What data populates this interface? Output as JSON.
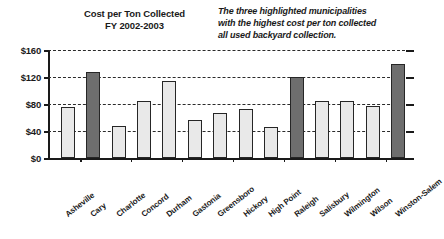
{
  "chart_data": {
    "type": "bar",
    "title": "Cost per Ton Collected FY 2002-2003",
    "title_lines": [
      "Cost per Ton Collected",
      "FY 2002-2003"
    ],
    "annotation": "The three highlighted municipalities with the highest cost per ton collected all used backyard collection.",
    "annotation_lines": [
      "The three highlighted municipalities",
      "with the highest cost per ton collected",
      "all used backyard collection."
    ],
    "xlabel": "",
    "ylabel": "",
    "ylim": [
      0,
      160
    ],
    "grid": true,
    "legend": "none",
    "ytick_labels": [
      "$0",
      "$40",
      "$80",
      "$120",
      "$160"
    ],
    "ytick_values": [
      0,
      40,
      80,
      120,
      160
    ],
    "categories": [
      "Asheville",
      "Cary",
      "Charlotte",
      "Concord",
      "Durham",
      "Gastonia",
      "Greensboro",
      "Hickory",
      "High Point",
      "Raleigh",
      "Salisbury",
      "Wilmington",
      "Wilson",
      "Winston-Salem"
    ],
    "values": [
      75,
      128,
      47,
      85,
      114,
      56,
      67,
      73,
      46,
      120,
      84,
      84,
      77,
      139
    ],
    "highlighted": [
      false,
      true,
      false,
      false,
      false,
      false,
      false,
      false,
      false,
      true,
      false,
      false,
      false,
      true
    ],
    "colors": {
      "bar_light": "#e9e9e9",
      "bar_dark": "#6e6e6e",
      "bar_border": "#262626",
      "axis": "#1a1a1a",
      "grid": "#2b2b2b"
    }
  }
}
